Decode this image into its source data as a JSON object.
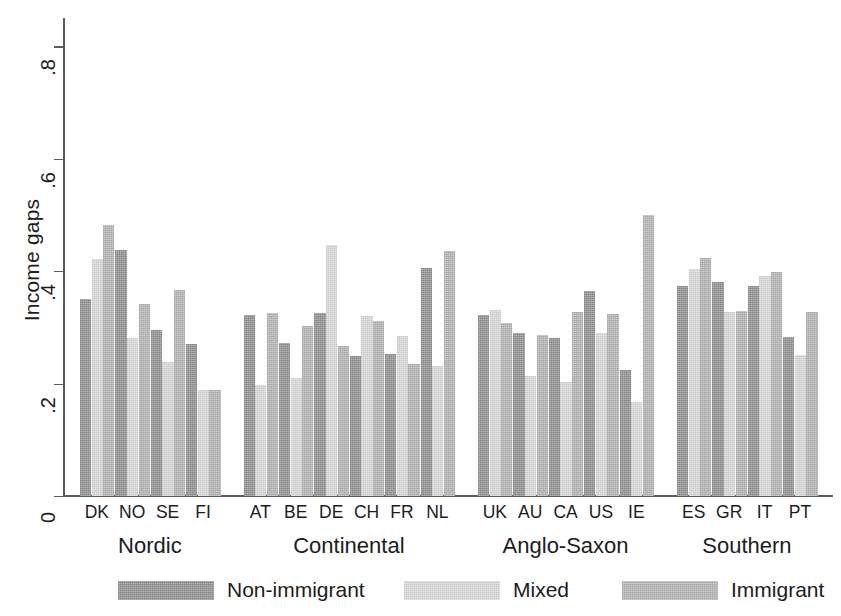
{
  "chart_data": {
    "type": "bar",
    "title": "",
    "xlabel": "",
    "ylabel": "Income gaps",
    "ylim": [
      0,
      0.85
    ],
    "yticks": [
      0,
      0.2,
      0.4,
      0.6,
      0.8
    ],
    "ytick_labels": [
      "0",
      ".2",
      ".4",
      ".6",
      ".8"
    ],
    "grid": false,
    "legend_position": "bottom",
    "categories": [
      "DK",
      "NO",
      "SE",
      "FI",
      "AT",
      "BE",
      "DE",
      "CH",
      "FR",
      "NL",
      "UK",
      "AU",
      "CA",
      "US",
      "IE",
      "ES",
      "GR",
      "IT",
      "PT"
    ],
    "groups": [
      {
        "label": "Nordic",
        "countries": [
          "DK",
          "NO",
          "SE",
          "FI"
        ]
      },
      {
        "label": "Continental",
        "countries": [
          "AT",
          "BE",
          "DE",
          "CH",
          "FR",
          "NL"
        ]
      },
      {
        "label": "Anglo-Saxon",
        "countries": [
          "UK",
          "AU",
          "CA",
          "US",
          "IE"
        ]
      },
      {
        "label": "Southern",
        "countries": [
          "ES",
          "GR",
          "IT",
          "PT"
        ]
      }
    ],
    "series": [
      {
        "name": "Non-immigrant",
        "color": "#8e8e8e",
        "values": [
          0.351,
          0.437,
          0.296,
          0.271,
          0.322,
          0.272,
          0.325,
          0.249,
          0.253,
          0.405,
          0.322,
          0.29,
          0.281,
          0.364,
          0.224,
          0.373,
          0.38,
          0.373,
          0.283
        ]
      },
      {
        "name": "Mixed",
        "color": "#d9d9d9",
        "values": [
          0.421,
          0.281,
          0.239,
          0.188,
          0.198,
          0.21,
          0.446,
          0.32,
          0.285,
          0.232,
          0.331,
          0.214,
          0.203,
          0.289,
          0.168,
          0.404,
          0.328,
          0.391,
          0.25
        ]
      },
      {
        "name": "Immigrant",
        "color": "#b3b3b3",
        "values": [
          0.482,
          0.342,
          0.367,
          0.188,
          0.325,
          0.303,
          0.267,
          0.312,
          0.235,
          0.435,
          0.308,
          0.287,
          0.328,
          0.324,
          0.499,
          0.423,
          0.329,
          0.399,
          0.327
        ]
      }
    ]
  },
  "axis": {
    "ylabel": "Income gaps",
    "tick_labels": [
      "0",
      ".2",
      ".4",
      ".6",
      ".8"
    ]
  },
  "legend": {
    "entries": [
      {
        "label": "Non-immigrant",
        "swatch": "non"
      },
      {
        "label": "Mixed",
        "swatch": "mix"
      },
      {
        "label": "Immigrant",
        "swatch": "imm"
      }
    ]
  }
}
